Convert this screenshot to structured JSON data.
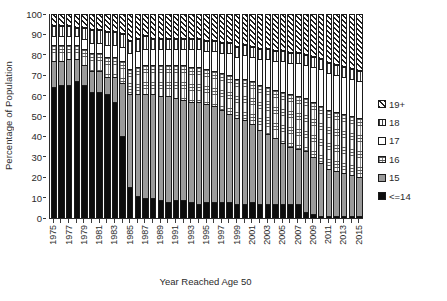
{
  "chart_data": {
    "type": "bar",
    "subtype": "stacked-bar-100-percent",
    "title": "",
    "xlabel": "Year Reached Age 50",
    "ylabel": "Percentage of Population",
    "ylim": [
      0,
      100
    ],
    "ytick_step": 10,
    "yticks": [
      0,
      10,
      20,
      30,
      40,
      50,
      60,
      70,
      80,
      90,
      100
    ],
    "grid": false,
    "legend_position": "right",
    "categories": [
      "1975",
      "1976",
      "1977",
      "1978",
      "1979",
      "1980",
      "1981",
      "1982",
      "1983",
      "1984",
      "1985",
      "1986",
      "1987",
      "1988",
      "1989",
      "1990",
      "1991",
      "1992",
      "1993",
      "1994",
      "1995",
      "1996",
      "1997",
      "1998",
      "1999",
      "2000",
      "2001",
      "2002",
      "2003",
      "2004",
      "2005",
      "2006",
      "2007",
      "2008",
      "2009",
      "2010",
      "2011",
      "2012",
      "2013",
      "2014",
      "2015"
    ],
    "xtick_labels_shown": [
      "1975",
      "1977",
      "1979",
      "1981",
      "1983",
      "1985",
      "1987",
      "1989",
      "1991",
      "1993",
      "1995",
      "1997",
      "1999",
      "2001",
      "2003",
      "2005",
      "2007",
      "2009",
      "2011",
      "2013",
      "2015"
    ],
    "series": [
      {
        "name": "<=14",
        "pattern": "solid-black",
        "color": "#0d0d0d",
        "values": [
          64,
          65,
          65,
          67,
          65,
          62,
          62,
          61,
          57,
          40,
          15,
          11,
          10,
          10,
          9,
          8,
          9,
          9,
          8,
          7,
          8,
          8,
          8,
          8,
          7,
          7,
          8,
          7,
          7,
          7,
          7,
          7,
          7,
          3,
          2,
          1,
          1,
          1,
          1,
          1,
          1
        ]
      },
      {
        "name": "15",
        "pattern": "solid-gray",
        "color": "#9a9a9a",
        "values": [
          13,
          12,
          13,
          11,
          10,
          10,
          10,
          8,
          12,
          26,
          46,
          50,
          51,
          51,
          51,
          52,
          50,
          49,
          49,
          50,
          48,
          47,
          45,
          43,
          42,
          41,
          38,
          36,
          34,
          32,
          30,
          28,
          27,
          30,
          28,
          26,
          23,
          22,
          21,
          20,
          19
        ]
      },
      {
        "name": "16",
        "pattern": "fine-grid-dotted",
        "color": "#ffffff",
        "values": [
          8,
          8,
          7,
          7,
          8,
          9,
          9,
          10,
          10,
          11,
          12,
          13,
          14,
          14,
          15,
          15,
          16,
          17,
          17,
          17,
          17,
          17,
          18,
          19,
          19,
          20,
          21,
          22,
          23,
          24,
          25,
          26,
          26,
          26,
          27,
          28,
          29,
          29,
          29,
          29,
          29
        ]
      },
      {
        "name": "17",
        "pattern": "white",
        "color": "#ffffff",
        "values": [
          4,
          4,
          4,
          4,
          5,
          5,
          5,
          6,
          6,
          7,
          8,
          8,
          8,
          8,
          8,
          8,
          8,
          8,
          9,
          9,
          9,
          10,
          10,
          11,
          11,
          12,
          12,
          13,
          14,
          14,
          15,
          15,
          16,
          16,
          17,
          18,
          18,
          18,
          18,
          18,
          18
        ]
      },
      {
        "name": "18",
        "pattern": "vertical-lines",
        "color": "#ffffff",
        "values": [
          5,
          5,
          5,
          4,
          5,
          6,
          6,
          6,
          6,
          6,
          6,
          6,
          6,
          5,
          5,
          5,
          5,
          5,
          5,
          5,
          5,
          5,
          5,
          5,
          5,
          5,
          5,
          5,
          5,
          5,
          5,
          5,
          5,
          5,
          5,
          5,
          5,
          5,
          5,
          5,
          5
        ]
      },
      {
        "name": "19+",
        "pattern": "diagonal-hatch",
        "color": "#ffffff",
        "values": [
          6,
          6,
          6,
          7,
          7,
          8,
          8,
          9,
          9,
          10,
          13,
          12,
          11,
          12,
          12,
          12,
          12,
          12,
          12,
          12,
          13,
          13,
          14,
          14,
          16,
          15,
          16,
          17,
          17,
          18,
          18,
          19,
          19,
          20,
          21,
          22,
          24,
          25,
          26,
          27,
          28
        ]
      }
    ],
    "legend_entries": [
      {
        "label": "19+",
        "pattern": "diagonal-hatch"
      },
      {
        "label": "18",
        "pattern": "vertical-lines"
      },
      {
        "label": "17",
        "pattern": "white"
      },
      {
        "label": "16",
        "pattern": "fine-grid-dotted"
      },
      {
        "label": "15",
        "pattern": "solid-gray"
      },
      {
        "label": "<=14",
        "pattern": "solid-black"
      }
    ]
  }
}
